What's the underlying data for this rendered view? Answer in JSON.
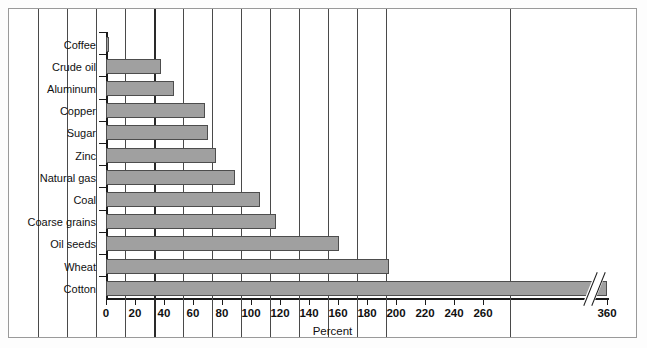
{
  "chart_data": {
    "type": "bar",
    "orientation": "horizontal",
    "title": "",
    "xlabel": "Percent",
    "ylabel": "",
    "categories": [
      "Coffee",
      "Crude oil",
      "Aluminum",
      "Copper",
      "Sugar",
      "Zinc",
      "Natural gas",
      "Coal",
      "Coarse grains",
      "Oil seeds",
      "Wheat",
      "Cotton"
    ],
    "values": [
      2,
      38,
      47,
      68,
      70,
      76,
      89,
      106,
      117,
      161,
      195,
      360
    ],
    "xticks": [
      0,
      20,
      40,
      60,
      80,
      100,
      120,
      140,
      160,
      180,
      200,
      220,
      240,
      260,
      360
    ],
    "xticklabels": [
      "0",
      "20",
      "40",
      "60",
      "80",
      "100",
      "120",
      "140",
      "160",
      "180",
      "200",
      "220",
      "240",
      "260",
      "360"
    ],
    "xlim": [
      0,
      280
    ],
    "axis_break": {
      "present": true,
      "between": [
        260,
        360
      ],
      "label_left": "260",
      "label_right": "360"
    },
    "grid": "vertical",
    "emphasized_gridline": 100,
    "legend": "none",
    "bar_color": "#a0a0a0",
    "bar_edge_color": "#4d4d4d",
    "grid_color": "#4a4a4a",
    "axis_color": "#1a1a1a",
    "frame_color": "#9a9a9a",
    "background": "#ffffff"
  }
}
